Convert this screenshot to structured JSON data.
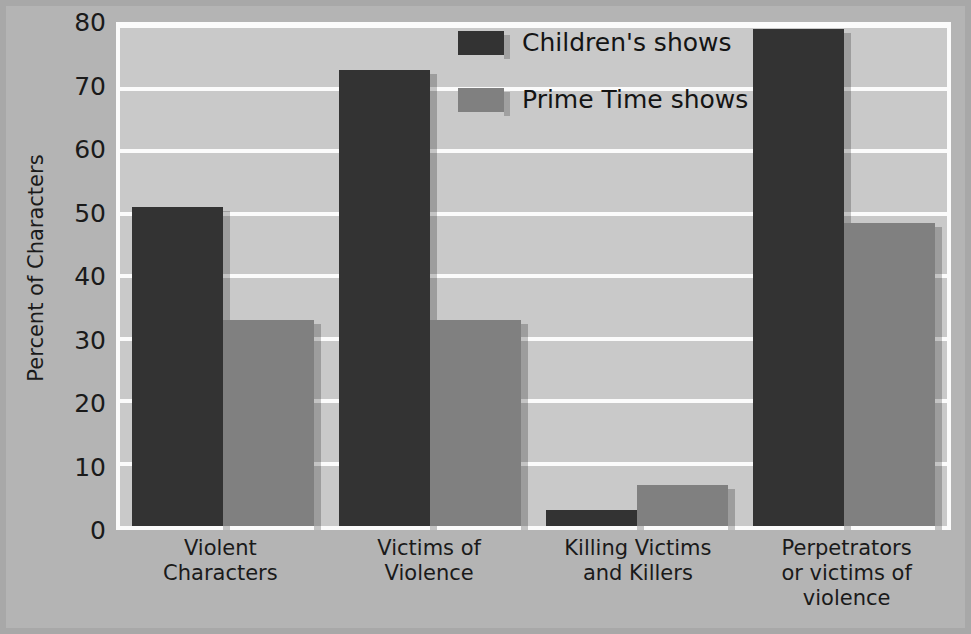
{
  "chart_data": {
    "type": "bar",
    "title": "",
    "xlabel": "",
    "ylabel": "Percent of Characters",
    "ylim": [
      0,
      80
    ],
    "ytick_values": [
      0,
      10,
      20,
      30,
      40,
      50,
      60,
      70,
      80
    ],
    "ytick_labels": [
      "0",
      "10",
      "20",
      "30",
      "40",
      "50",
      "60",
      "70",
      "80"
    ],
    "grid": true,
    "legend_position": "top-center",
    "categories": [
      "Violent Characters",
      "Victims of Violence",
      "Killing Victims and Killers",
      "Perpetrators or victims of violence"
    ],
    "category_lines": [
      [
        "Violent",
        "Characters"
      ],
      [
        "Victims of",
        "Violence"
      ],
      [
        "Killing Victims",
        "and Killers"
      ],
      [
        "Perpetrators",
        "or victims of",
        "violence"
      ]
    ],
    "series": [
      {
        "name": "Children's shows",
        "color": "#333333",
        "values": [
          51,
          73,
          2.5,
          79.5
        ]
      },
      {
        "name": "Prime Time shows",
        "color": "#808080",
        "values": [
          33,
          33,
          6.5,
          48.5
        ]
      }
    ]
  },
  "colors": {
    "figure_background": "#b4b4b4",
    "plot_background": "#c9c9c9",
    "gridline": "#fbfbfb",
    "axis_border": "#fbfbfb",
    "text": "#1a1a1a",
    "series_children": "#333333",
    "series_primetime": "#808080"
  }
}
